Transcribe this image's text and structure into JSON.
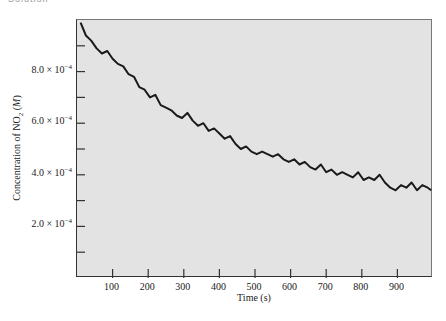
{
  "header": {
    "partial_text": "Solution"
  },
  "chart_data": {
    "type": "line",
    "title": "",
    "xlabel": "Time (s)",
    "ylabel": "Concentration of NO2 (M)",
    "ylabel_parts": {
      "prefix": "Concentration of NO",
      "sub": "2",
      "suffix": " (M)"
    },
    "xlim": [
      0,
      1000
    ],
    "ylim": [
      0,
      0.001
    ],
    "x_ticks": [
      100,
      200,
      300,
      400,
      500,
      600,
      700,
      800,
      900
    ],
    "x_tick_labels": [
      "100",
      "200",
      "300",
      "400",
      "500",
      "600",
      "700",
      "800",
      "900"
    ],
    "y_ticks_labeled": [
      0.0002,
      0.0004,
      0.0006,
      0.0008
    ],
    "y_tick_labels": [
      {
        "mant": "2.0 × 10",
        "exp": "−4"
      },
      {
        "mant": "4.0 × 10",
        "exp": "−4"
      },
      {
        "mant": "6.0 × 10",
        "exp": "−4"
      },
      {
        "mant": "8.0 × 10",
        "exp": "−4"
      }
    ],
    "y_minor_ticks": [
      0.0001,
      0.0003,
      0.0005,
      0.0007,
      0.0009
    ],
    "grid": false,
    "series": [
      {
        "name": "[NO2]",
        "color": "#1a1a1a",
        "x": [
          10,
          25,
          40,
          55,
          70,
          85,
          100,
          115,
          130,
          145,
          160,
          175,
          190,
          205,
          220,
          235,
          250,
          265,
          280,
          295,
          310,
          325,
          340,
          355,
          370,
          385,
          400,
          415,
          430,
          445,
          460,
          475,
          490,
          505,
          520,
          535,
          550,
          565,
          580,
          595,
          610,
          625,
          640,
          655,
          670,
          685,
          700,
          715,
          730,
          745,
          760,
          775,
          790,
          805,
          820,
          835,
          850,
          865,
          880,
          895,
          910,
          925,
          940,
          955,
          970,
          985,
          995
        ],
        "values": [
          0.00099,
          0.00094,
          0.00092,
          0.00089,
          0.00087,
          0.00088,
          0.00085,
          0.00083,
          0.00082,
          0.00079,
          0.00078,
          0.00074,
          0.00073,
          0.0007,
          0.00071,
          0.00067,
          0.00066,
          0.00065,
          0.00063,
          0.00062,
          0.00064,
          0.00061,
          0.00059,
          0.0006,
          0.00057,
          0.00058,
          0.00056,
          0.00054,
          0.00055,
          0.00052,
          0.0005,
          0.00051,
          0.00049,
          0.00048,
          0.00049,
          0.00048,
          0.00047,
          0.00048,
          0.00046,
          0.00045,
          0.00046,
          0.00044,
          0.00045,
          0.00043,
          0.00042,
          0.00044,
          0.00041,
          0.00042,
          0.0004,
          0.00041,
          0.0004,
          0.00039,
          0.00041,
          0.00038,
          0.00039,
          0.00038,
          0.0004,
          0.00037,
          0.00035,
          0.00034,
          0.00036,
          0.00035,
          0.00037,
          0.00034,
          0.00036,
          0.00035,
          0.00034
        ]
      }
    ],
    "background_color": "#e3e3e3",
    "legend": null
  }
}
